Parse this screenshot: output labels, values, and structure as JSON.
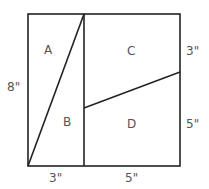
{
  "diagram": {
    "regions": [
      {
        "id": "A",
        "label": "A"
      },
      {
        "id": "B",
        "label": "B"
      },
      {
        "id": "C",
        "label": "C"
      },
      {
        "id": "D",
        "label": "D"
      }
    ],
    "dimensions": {
      "left_height": "8\"",
      "right_top": "3\"",
      "right_bottom": "5\"",
      "bottom_left": "3\"",
      "bottom_right": "5\""
    },
    "colors": {
      "stroke": "#222222",
      "text": "#555555",
      "background": "#ffffff"
    }
  }
}
